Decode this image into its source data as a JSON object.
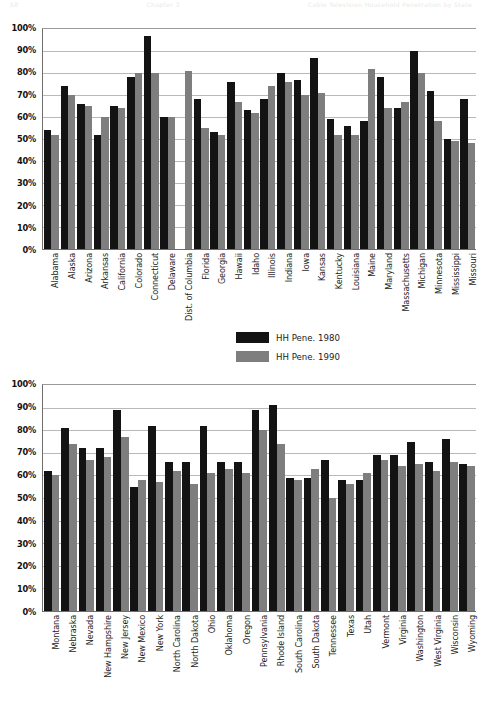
{
  "page": {
    "header_left": "58",
    "header_center": "Chapter 3",
    "header_right": "Cable Television Household Penetration by State"
  },
  "legend": {
    "position": "below-chart1",
    "items": [
      {
        "label": "HH Pene. 1980",
        "color": "#131313",
        "icon": "legend-swatch"
      },
      {
        "label": "HH Pene. 1990",
        "color": "#7e7e7e",
        "icon": "legend-swatch"
      }
    ]
  },
  "chart_data": [
    {
      "id": "chart-top",
      "type": "bar",
      "title": "",
      "xlabel": "",
      "ylabel": "",
      "ylim": [
        0,
        100
      ],
      "ytick_labels": [
        "100%",
        "90%",
        "80%",
        "70%",
        "60%",
        "50%",
        "40%",
        "30%",
        "20%",
        "10%",
        "0%"
      ],
      "yticks": [
        100,
        90,
        80,
        70,
        60,
        50,
        40,
        30,
        20,
        10,
        0
      ],
      "grid": true,
      "legend_position": "below",
      "categories": [
        "Alabama",
        "Alaska",
        "Arizona",
        "Arkansas",
        "California",
        "Colorado",
        "Connecticut",
        "Delaware",
        "Dist. of Columbia",
        "Florida",
        "Georgia",
        "Hawaii",
        "Idaho",
        "Illinois",
        "Indiana",
        "Iowa",
        "Kansas",
        "Kentucky",
        "Louisiana",
        "Maine",
        "Maryland",
        "Massachusetts",
        "Michigan",
        "Minnesota",
        "Mississippi",
        "Missouri"
      ],
      "series": [
        {
          "name": "HH Pene. 1980",
          "color": "#131313",
          "values": [
            54,
            74,
            66,
            52,
            65,
            78,
            97,
            60,
            0,
            68,
            53,
            76,
            63,
            68,
            80,
            77,
            87,
            59,
            56,
            58,
            78,
            64,
            90,
            72,
            50,
            68
          ]
        },
        {
          "name": "HH Pene. 1990",
          "color": "#7e7e7e",
          "values": [
            52,
            70,
            65,
            60,
            64,
            80,
            80,
            60,
            81,
            55,
            52,
            67,
            62,
            74,
            76,
            70,
            71,
            52,
            52,
            82,
            64,
            67,
            80,
            58,
            49,
            48
          ]
        }
      ]
    },
    {
      "id": "chart-bottom",
      "type": "bar",
      "title": "",
      "xlabel": "",
      "ylabel": "",
      "ylim": [
        0,
        100
      ],
      "ytick_labels": [
        "100%",
        "90%",
        "80%",
        "70%",
        "60%",
        "50%",
        "40%",
        "30%",
        "20%",
        "10%",
        "0%"
      ],
      "yticks": [
        100,
        90,
        80,
        70,
        60,
        50,
        40,
        30,
        20,
        10,
        0
      ],
      "grid": true,
      "legend_position": "none",
      "categories": [
        "Montana",
        "Nebraska",
        "Nevada",
        "New Hampshire",
        "New Jersey",
        "New Mexico",
        "New York",
        "North Carolina",
        "North Dakota",
        "Ohio",
        "Oklahoma",
        "Oregon",
        "Pennsylvania",
        "Rhode Island",
        "South Carolina",
        "South Dakota",
        "Tennessee",
        "Texas",
        "Utah",
        "Vermont",
        "Virginia",
        "Washington",
        "West Virginia",
        "Wisconsin",
        "Wyoming"
      ],
      "series": [
        {
          "name": "HH Pene. 1980",
          "color": "#131313",
          "values": [
            62,
            81,
            72,
            72,
            89,
            55,
            82,
            66,
            66,
            82,
            66,
            66,
            89,
            91,
            59,
            59,
            67,
            58,
            58,
            69,
            69,
            75,
            66,
            76,
            65
          ]
        },
        {
          "name": "HH Pene. 1990",
          "color": "#7e7e7e",
          "values": [
            60,
            74,
            67,
            68,
            77,
            58,
            57,
            62,
            56,
            61,
            63,
            61,
            80,
            74,
            58,
            63,
            50,
            56,
            61,
            67,
            64,
            65,
            62,
            66,
            64
          ]
        }
      ]
    }
  ]
}
